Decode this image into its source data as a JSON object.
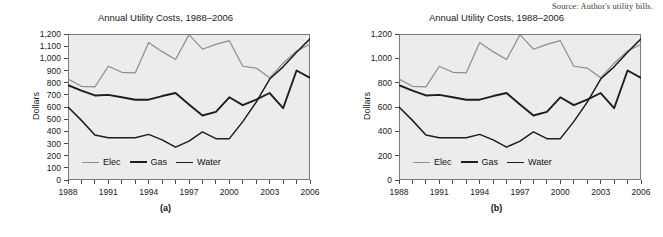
{
  "source_note": "Source: Author's utility bills.",
  "panels": [
    {
      "id": "a",
      "caption": "(a)",
      "title": "Annual Utility Costs, 1988–2006",
      "ylabel": "Dollars",
      "yticks": [
        "0",
        "100",
        "200",
        "300",
        "400",
        "500",
        "600",
        "700",
        "800",
        "900",
        "1,000",
        "1,100",
        "1,200"
      ],
      "ytick_values": [
        0,
        100,
        200,
        300,
        400,
        500,
        600,
        700,
        800,
        900,
        1000,
        1100,
        1200
      ],
      "xticks": [
        "1988",
        "1991",
        "1994",
        "1997",
        "2000",
        "2003",
        "2006"
      ],
      "xtick_values": [
        1988,
        1991,
        1994,
        1997,
        2000,
        2003,
        2006
      ],
      "legend": [
        {
          "label": "Elec",
          "color": "#8d8d8d"
        },
        {
          "label": "Gas",
          "color": "#1d1d1d"
        },
        {
          "label": "Water",
          "color": "#1d1d1d"
        }
      ]
    },
    {
      "id": "b",
      "caption": "(b)",
      "title": "Annual Utility Costs, 1988–2006",
      "ylabel": "Dollars",
      "yticks": [
        "0",
        "200",
        "400",
        "600",
        "800",
        "1,000",
        "1,200"
      ],
      "ytick_values": [
        0,
        200,
        400,
        600,
        800,
        1000,
        1200
      ],
      "xticks": [
        "1988",
        "1991",
        "1994",
        "1997",
        "2000",
        "2003",
        "2006"
      ],
      "xtick_values": [
        1988,
        1991,
        1994,
        1997,
        2000,
        2003,
        2006
      ],
      "legend": [
        {
          "label": "Elec",
          "color": "#8d8d8d"
        },
        {
          "label": "Gas",
          "color": "#1d1d1d"
        },
        {
          "label": "Water",
          "color": "#1d1d1d"
        }
      ]
    }
  ],
  "chart_data": [
    {
      "type": "line",
      "panel": "a",
      "title": "Annual Utility Costs, 1988–2006",
      "xlabel": "",
      "ylabel": "Dollars",
      "ylim": [
        0,
        1200
      ],
      "xlim": [
        1988,
        2006
      ],
      "ytick_step": 100,
      "xtick_step": 3,
      "grid": false,
      "legend_position": "inside-bottom-left",
      "x": [
        1988,
        1989,
        1990,
        1991,
        1992,
        1993,
        1994,
        1995,
        1996,
        1997,
        1998,
        1999,
        2000,
        2001,
        2002,
        2003,
        2004,
        2005,
        2006
      ],
      "series": [
        {
          "name": "Elec",
          "color": "#8d8d8d",
          "values": [
            830,
            770,
            765,
            935,
            885,
            880,
            1130,
            1055,
            990,
            1195,
            1075,
            1115,
            1145,
            935,
            920,
            840,
            960,
            1060,
            1115
          ]
        },
        {
          "name": "Gas",
          "color": "#1d1d1d",
          "values": [
            780,
            735,
            695,
            700,
            680,
            660,
            660,
            690,
            715,
            620,
            530,
            560,
            680,
            615,
            660,
            715,
            590,
            900,
            840
          ]
        },
        {
          "name": "Water",
          "color": "#1d1d1d",
          "values": [
            600,
            490,
            370,
            348,
            348,
            348,
            375,
            330,
            270,
            320,
            395,
            340,
            340,
            480,
            640,
            830,
            930,
            1050,
            1160
          ]
        }
      ]
    },
    {
      "type": "line",
      "panel": "b",
      "title": "Annual Utility Costs, 1988–2006",
      "xlabel": "",
      "ylabel": "Dollars",
      "ylim": [
        0,
        1200
      ],
      "xlim": [
        1988,
        2006
      ],
      "ytick_step": 200,
      "xtick_step": 3,
      "grid": false,
      "legend_position": "inside-bottom-left",
      "x": [
        1988,
        1989,
        1990,
        1991,
        1992,
        1993,
        1994,
        1995,
        1996,
        1997,
        1998,
        1999,
        2000,
        2001,
        2002,
        2003,
        2004,
        2005,
        2006
      ],
      "series": [
        {
          "name": "Elec",
          "color": "#8d8d8d",
          "values": [
            830,
            770,
            765,
            935,
            885,
            880,
            1130,
            1055,
            990,
            1195,
            1075,
            1115,
            1145,
            935,
            920,
            840,
            960,
            1060,
            1115
          ]
        },
        {
          "name": "Gas",
          "color": "#1d1d1d",
          "values": [
            780,
            735,
            695,
            700,
            680,
            660,
            660,
            690,
            715,
            620,
            530,
            560,
            680,
            615,
            660,
            715,
            590,
            900,
            840
          ]
        },
        {
          "name": "Water",
          "color": "#1d1d1d",
          "values": [
            600,
            490,
            370,
            348,
            348,
            348,
            375,
            330,
            270,
            320,
            395,
            340,
            340,
            480,
            640,
            830,
            930,
            1050,
            1160
          ]
        }
      ]
    }
  ]
}
